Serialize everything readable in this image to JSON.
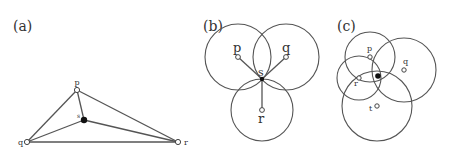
{
  "figure": {
    "panels": [
      {
        "id": "a",
        "label": "(a)",
        "points": {
          "p": {
            "label": "p",
            "x": 77,
            "y": 90
          },
          "q": {
            "label": "q",
            "x": 27,
            "y": 142
          },
          "r": {
            "label": "r",
            "x": 178,
            "y": 142
          },
          "s": {
            "label": "s",
            "x": 84,
            "y": 120
          }
        },
        "edges": [
          [
            "p",
            "q"
          ],
          [
            "q",
            "r"
          ],
          [
            "p",
            "r"
          ],
          [
            "p",
            "s"
          ],
          [
            "q",
            "s"
          ],
          [
            "r",
            "s"
          ]
        ]
      },
      {
        "id": "b",
        "label": "(b)",
        "points": {
          "p": {
            "label": "p",
            "x": 238,
            "y": 57
          },
          "q": {
            "label": "q",
            "x": 286,
            "y": 57
          },
          "r": {
            "label": "r",
            "x": 262,
            "y": 110
          },
          "s": {
            "label": "s",
            "x": 262,
            "y": 79
          }
        },
        "circles": [
          {
            "center": "p",
            "r": 33
          },
          {
            "center": "q",
            "r": 33
          },
          {
            "center": "r",
            "r": 31
          }
        ]
      },
      {
        "id": "c",
        "label": "(c)",
        "points": {
          "p": {
            "label": "p",
            "x": 370,
            "y": 57
          },
          "q": {
            "label": "q",
            "x": 404,
            "y": 70
          },
          "r": {
            "label": "r",
            "x": 359,
            "y": 78
          },
          "t": {
            "label": "t",
            "x": 377,
            "y": 106
          },
          "s": {
            "label": "",
            "x": 378,
            "y": 76
          }
        },
        "circles": [
          {
            "center": "p",
            "r": 25
          },
          {
            "center": "q",
            "r": 32
          },
          {
            "center": "r",
            "r": 22
          },
          {
            "center": "t",
            "r": 35
          }
        ]
      }
    ]
  }
}
